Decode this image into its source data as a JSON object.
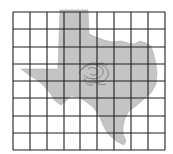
{
  "map": {
    "subject": "Texas state silhouette with grid overlay",
    "colors": {
      "background": "#ffffff",
      "state_fill": "#c4c4c4",
      "grid_line": "#1e1e1e",
      "contour_line": "#6a6a6a"
    },
    "grid": {
      "columns": 9,
      "rows": 8,
      "x_lines": [
        13,
        30,
        47,
        64,
        80,
        97,
        114,
        131,
        148,
        165
      ],
      "y_lines": [
        12,
        29,
        47,
        64,
        81,
        98,
        116,
        133,
        150
      ]
    },
    "features": [
      {
        "name": "state-outline",
        "label": "Texas"
      },
      {
        "name": "central-contours",
        "label": "scribbled contour cluster near center"
      }
    ]
  }
}
